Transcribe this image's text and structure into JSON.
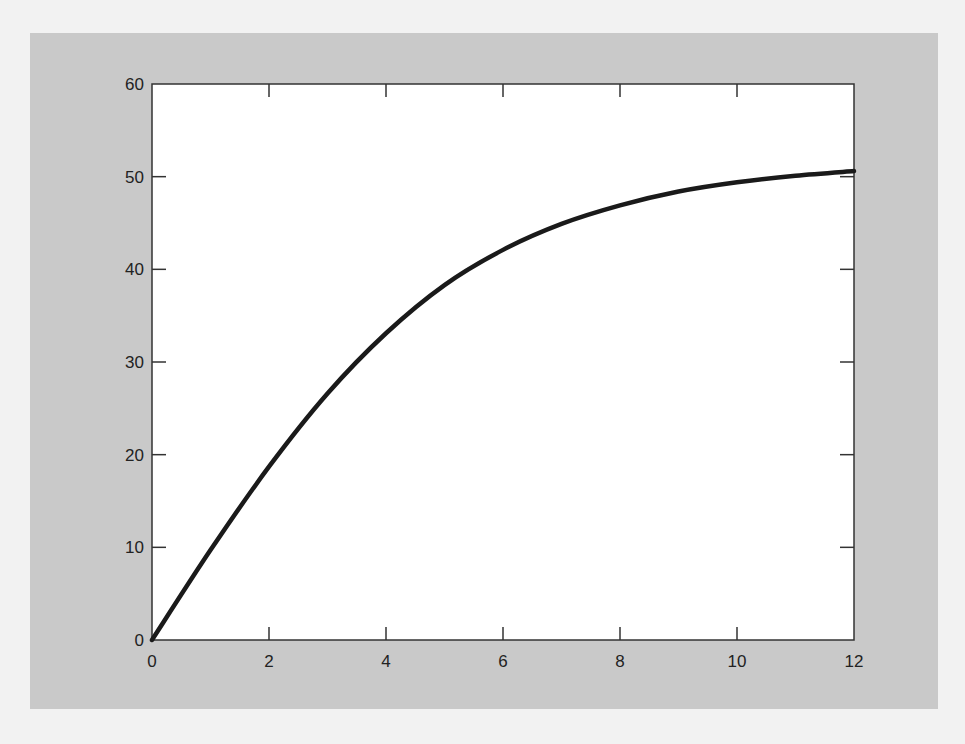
{
  "chart_data": {
    "type": "line",
    "title": "",
    "xlabel": "",
    "ylabel": "",
    "xlim": [
      0,
      12
    ],
    "ylim": [
      0,
      60
    ],
    "grid": false,
    "legend": null,
    "x_ticks": [
      "0",
      "2",
      "4",
      "6",
      "8",
      "10",
      "12"
    ],
    "y_ticks": [
      "0",
      "10",
      "20",
      "30",
      "40",
      "50",
      "60"
    ],
    "series": [
      {
        "name": "curve",
        "color": "#1a1a1a",
        "x": [
          0,
          1,
          2,
          3,
          4,
          5,
          6,
          7,
          8,
          9,
          10,
          11,
          12
        ],
        "values": [
          0,
          9.7,
          18.7,
          26.6,
          33.1,
          38.3,
          42.1,
          44.9,
          46.9,
          48.4,
          49.4,
          50.1,
          50.6
        ]
      }
    ]
  },
  "colors": {
    "page_background": "#f2f2f2",
    "panel_background": "#c9c9c9",
    "plot_background": "#ffffff",
    "axis_color": "#333333",
    "line_color": "#1a1a1a"
  }
}
